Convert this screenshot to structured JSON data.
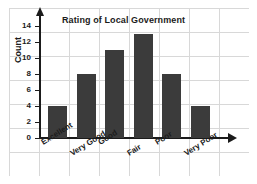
{
  "chart_data": {
    "type": "bar",
    "title": "Rating of Local Government",
    "xlabel": "",
    "ylabel": "Count",
    "categories": [
      "Excellent",
      "Very Good",
      "Good",
      "Fair",
      "Poor",
      "Very Poor"
    ],
    "values": [
      4,
      8,
      11,
      13,
      8,
      4
    ],
    "ylim": [
      0,
      14
    ],
    "yticks": [
      0,
      2,
      4,
      6,
      8,
      10,
      12,
      14
    ],
    "ytick_labels": [
      "0",
      "2",
      "4",
      "6",
      "8",
      "10",
      "12",
      "14"
    ],
    "grid": true,
    "legend": null,
    "bar_color": "#3b3b3b",
    "axis_color": "#1b1b1b",
    "grid_color": "#b9b9b9",
    "background_color": "#ffffff"
  }
}
